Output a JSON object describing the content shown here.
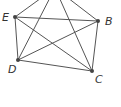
{
  "diagram": {
    "type": "complete-graph",
    "vertices": [
      {
        "id": "A",
        "label": "",
        "x": 55,
        "y": -12
      },
      {
        "id": "B",
        "label": "B",
        "x": 98,
        "y": 21
      },
      {
        "id": "C",
        "label": "C",
        "x": 92,
        "y": 71
      },
      {
        "id": "D",
        "label": "D",
        "x": 18,
        "y": 60
      },
      {
        "id": "E",
        "label": "E",
        "x": 15,
        "y": 17
      }
    ],
    "edges": [
      [
        "A",
        "B"
      ],
      [
        "A",
        "C"
      ],
      [
        "A",
        "D"
      ],
      [
        "A",
        "E"
      ],
      [
        "B",
        "C"
      ],
      [
        "B",
        "D"
      ],
      [
        "B",
        "E"
      ],
      [
        "C",
        "D"
      ],
      [
        "C",
        "E"
      ],
      [
        "D",
        "E"
      ]
    ],
    "colors": {
      "edge": "#555555",
      "vertex": "#444444"
    }
  }
}
